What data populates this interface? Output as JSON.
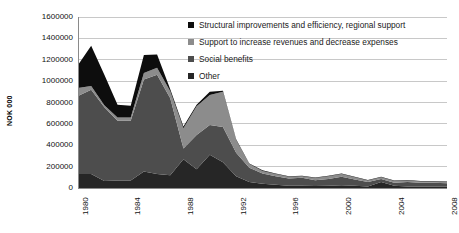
{
  "chart_data": {
    "type": "area",
    "stacked": true,
    "title": "",
    "subtitle": "",
    "xlabel": "",
    "ylabel": "NOK 000",
    "ylim": [
      0,
      1600000
    ],
    "y_ticks": [
      0,
      200000,
      400000,
      600000,
      800000,
      1000000,
      1200000,
      1400000,
      1600000
    ],
    "y_tick_labels": [
      "0",
      "200000",
      "400000",
      "600000",
      "800000",
      "1000000",
      "1200000",
      "1400000",
      "1600000"
    ],
    "xlim": [
      1980,
      2008
    ],
    "x": [
      1980,
      1981,
      1982,
      1983,
      1984,
      1985,
      1986,
      1987,
      1988,
      1989,
      1990,
      1991,
      1992,
      1993,
      1994,
      1995,
      1996,
      1997,
      1998,
      1999,
      2000,
      2001,
      2002,
      2003,
      2004,
      2005,
      2006,
      2007,
      2008
    ],
    "x_tick_labels": [
      "1980",
      "1984",
      "1988",
      "1992",
      "1996",
      "2000",
      "2004",
      "2008"
    ],
    "x_ticks": [
      1980,
      1984,
      1988,
      1992,
      1996,
      2000,
      2004,
      2008
    ],
    "grid": "horizontal",
    "legend_position": "top-right",
    "stack_order_bottom_to_top": [
      "Other",
      "Social benefits",
      "Support to increase revenues and decrease expenses",
      "Structural improvements and efficiency, regional support"
    ],
    "series": [
      {
        "name": "Other",
        "color": "#262626",
        "values": [
          130000,
          130000,
          65000,
          70000,
          70000,
          155000,
          130000,
          120000,
          270000,
          175000,
          310000,
          240000,
          110000,
          55000,
          40000,
          30000,
          20000,
          20000,
          18000,
          20000,
          25000,
          20000,
          15000,
          55000,
          20000,
          15000,
          15000,
          15000,
          15000
        ]
      },
      {
        "name": "Social benefits",
        "color": "#4d4d4d",
        "values": [
          730000,
          790000,
          690000,
          560000,
          560000,
          860000,
          930000,
          720000,
          100000,
          320000,
          280000,
          330000,
          220000,
          135000,
          95000,
          80000,
          70000,
          75000,
          55000,
          65000,
          80000,
          60000,
          40000,
          30000,
          30000,
          40000,
          35000,
          35000,
          30000
        ]
      },
      {
        "name": "Support to increase revenues and decrease expenses",
        "color": "#8c8c8c",
        "values": [
          75000,
          35000,
          20000,
          30000,
          30000,
          60000,
          65000,
          65000,
          190000,
          270000,
          280000,
          330000,
          120000,
          35000,
          25000,
          20000,
          15000,
          15000,
          20000,
          25000,
          25000,
          20000,
          15000,
          15000,
          15000,
          15000,
          10000,
          10000,
          10000
        ]
      },
      {
        "name": "Structural improvements and efficiency, regional support",
        "color": "#0d0d0d",
        "values": [
          215000,
          375000,
          285000,
          120000,
          110000,
          170000,
          125000,
          20000,
          15000,
          15000,
          30000,
          10000,
          5000,
          5000,
          5000,
          5000,
          5000,
          5000,
          5000,
          5000,
          5000,
          5000,
          5000,
          5000,
          5000,
          5000,
          5000,
          5000,
          5000
        ]
      }
    ]
  },
  "legend": {
    "items": [
      {
        "label": "Structural improvements and efficiency, regional support",
        "color": "#0d0d0d"
      },
      {
        "label": "Support to increase revenues and decrease expenses",
        "color": "#8c8c8c"
      },
      {
        "label": "Social benefits",
        "color": "#4d4d4d"
      },
      {
        "label": "Other",
        "color": "#262626"
      }
    ]
  },
  "axes": {
    "y_title": "NOK 000"
  },
  "colors": {
    "grid": "#c8c8c8",
    "axis": "#8a8a8a",
    "text": "#111111",
    "background": "#ffffff"
  }
}
